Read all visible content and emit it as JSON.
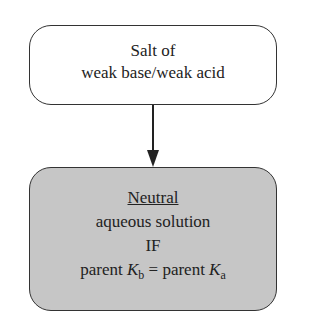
{
  "top_box": {
    "line1": "Salt of",
    "line2": "weak base/weak acid"
  },
  "bottom_box": {
    "title": "Neutral",
    "line2": "aqueous solution",
    "line3": "IF",
    "eq": {
      "left_word": "parent ",
      "left_symbol": "K",
      "left_sub": "b",
      "equals": " = parent ",
      "right_symbol": "K",
      "right_sub": "a"
    }
  },
  "colors": {
    "bottom_fill": "#c6c6c6",
    "stroke": "#333333"
  }
}
